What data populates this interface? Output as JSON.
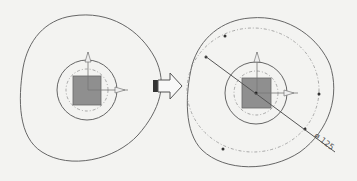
{
  "diagram": {
    "title": "",
    "left_panel": {
      "name": "before",
      "outer_contour": "rounded triangular profile",
      "inner_circle": "solid circle",
      "dashed_circle": "dash-dot circle",
      "square": "gray square boss",
      "axes": [
        "up-arrow",
        "right-arrow"
      ]
    },
    "transition_arrow": {
      "direction": "right"
    },
    "right_panel": {
      "name": "after",
      "outer_contour": "rounded triangular profile",
      "pitch_circle": "dash-dot circle with points",
      "dimension": {
        "label": "ø 125"
      }
    },
    "colors": {
      "background": "#f3f3f1",
      "line": "#666666",
      "square_fill": "#8f8f8f",
      "dash": "#888888"
    }
  }
}
